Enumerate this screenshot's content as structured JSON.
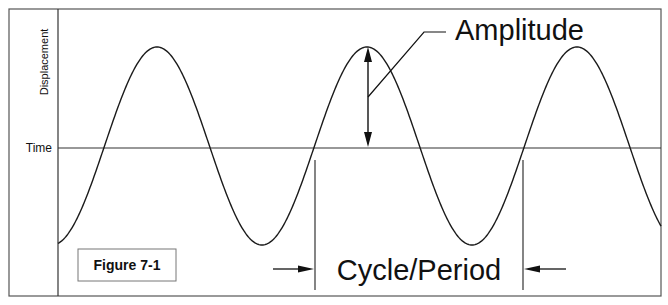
{
  "figure": {
    "label": "Figure 7-1",
    "y_axis_label": "Displacement",
    "x_axis_label": "Time",
    "amplitude_label": "Amplitude",
    "period_label": "Cycle/Period"
  },
  "colors": {
    "line": "#1a1a1a",
    "border": "#555555",
    "background": "#ffffff"
  },
  "wave": {
    "type": "sine",
    "cycles_shown": 2.9,
    "peaks_visible": 3,
    "troughs_visible": 2
  }
}
